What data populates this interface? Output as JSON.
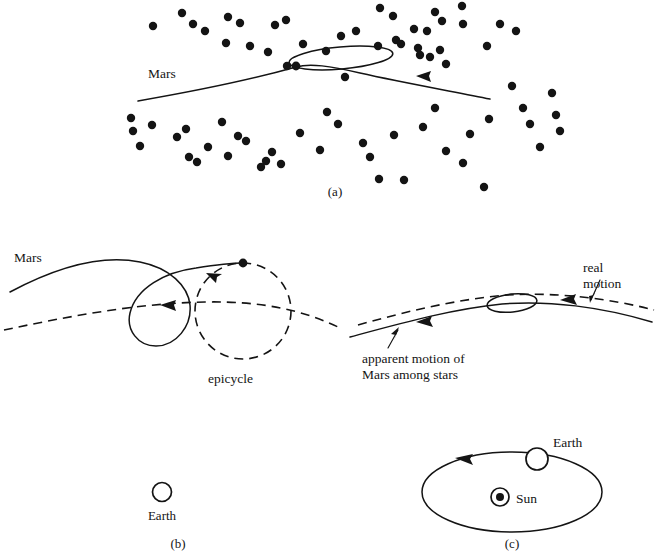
{
  "figure": {
    "background_color": "#ffffff",
    "ink_color": "#141414"
  },
  "panels": [
    {
      "id": "a",
      "caption": "(a)",
      "caption_x": 335,
      "caption_y": 196,
      "description": "Apparent path of Mars among the stars showing a retrograde loop",
      "labels": [
        {
          "name": "mars-label",
          "text": "Mars",
          "x": 148,
          "y": 78
        }
      ]
    },
    {
      "id": "b",
      "caption": "(b)",
      "caption_x": 178,
      "caption_y": 548,
      "description": "Ptolemaic epicycle explanation with deferent and epicycle",
      "labels": [
        {
          "name": "mars-label",
          "text": "Mars",
          "x": 14,
          "y": 262
        },
        {
          "name": "epicycle-label",
          "text": "epicycle",
          "x": 208,
          "y": 383
        },
        {
          "name": "earth-label",
          "text": "Earth",
          "x": 145,
          "y": 516
        }
      ]
    },
    {
      "id": "c",
      "caption": "(c)",
      "caption_x": 512,
      "caption_y": 548,
      "description": "Heliocentric explanation: Earth orbiting the Sun overtakes Mars",
      "labels": [
        {
          "name": "real-motion-label-line1",
          "text": "real",
          "x": 583,
          "y": 280
        },
        {
          "name": "real-motion-label-line2",
          "text": "motion",
          "x": 583,
          "y": 295
        },
        {
          "name": "apparent-motion-label-line1",
          "text": "apparent motion of",
          "x": 362,
          "y": 361
        },
        {
          "name": "apparent-motion-label-line2",
          "text": "Mars among stars",
          "x": 362,
          "y": 376
        },
        {
          "name": "earth-label",
          "text": "Earth",
          "x": 524,
          "y": 443
        },
        {
          "name": "sun-label",
          "text": "Sun",
          "x": 519,
          "y": 503
        }
      ]
    }
  ],
  "panel_a": {
    "path_points": "138,101 175,93 215,86 258,78 290,70 305,66 330,68 370,76 410,84 450,90 490,98",
    "loop_ellipse": {
      "cx": 341,
      "cy": 58,
      "rx": 52,
      "ry": 11,
      "rotation": -5
    },
    "mars_dot": {
      "cx": 296,
      "cy": 66,
      "r": 4.2
    },
    "arrow": {
      "x": 424,
      "y": 76,
      "direction": "left"
    },
    "stars": [
      [
        153,
        26
      ],
      [
        182,
        13
      ],
      [
        193,
        24
      ],
      [
        205,
        31
      ],
      [
        226,
        43
      ],
      [
        228,
        17
      ],
      [
        240,
        23
      ],
      [
        250,
        46
      ],
      [
        268,
        52
      ],
      [
        275,
        25
      ],
      [
        286,
        20
      ],
      [
        287,
        66
      ],
      [
        303,
        44
      ],
      [
        326,
        51
      ],
      [
        341,
        36
      ],
      [
        345,
        77
      ],
      [
        356,
        31
      ],
      [
        378,
        46
      ],
      [
        380,
        8
      ],
      [
        393,
        16
      ],
      [
        396,
        40
      ],
      [
        401,
        44
      ],
      [
        414,
        29
      ],
      [
        418,
        48
      ],
      [
        420,
        55
      ],
      [
        427,
        31
      ],
      [
        430,
        57
      ],
      [
        435,
        12
      ],
      [
        440,
        50
      ],
      [
        442,
        21
      ],
      [
        446,
        64
      ],
      [
        462,
        6
      ],
      [
        463,
        24
      ],
      [
        487,
        46
      ],
      [
        500,
        24
      ],
      [
        516,
        31
      ],
      [
        131,
        118
      ],
      [
        133,
        131
      ],
      [
        140,
        146
      ],
      [
        152,
        125
      ],
      [
        177,
        137
      ],
      [
        186,
        129
      ],
      [
        189,
        157
      ],
      [
        197,
        162
      ],
      [
        208,
        147
      ],
      [
        222,
        122
      ],
      [
        228,
        156
      ],
      [
        238,
        136
      ],
      [
        246,
        141
      ],
      [
        261,
        167
      ],
      [
        266,
        161
      ],
      [
        272,
        152
      ],
      [
        281,
        164
      ],
      [
        300,
        133
      ],
      [
        320,
        150
      ],
      [
        327,
        112
      ],
      [
        338,
        124
      ],
      [
        363,
        143
      ],
      [
        370,
        157
      ],
      [
        379,
        179
      ],
      [
        394,
        135
      ],
      [
        404,
        180
      ],
      [
        423,
        127
      ],
      [
        435,
        108
      ],
      [
        446,
        151
      ],
      [
        463,
        163
      ],
      [
        470,
        134
      ],
      [
        484,
        187
      ],
      [
        489,
        119
      ],
      [
        512,
        86
      ],
      [
        523,
        108
      ],
      [
        530,
        124
      ],
      [
        540,
        147
      ],
      [
        552,
        93
      ],
      [
        556,
        115
      ],
      [
        560,
        131
      ]
    ]
  },
  "panel_b": {
    "mars_loop_path": "M 10,292 C 60,268 110,255 152,268 C 190,280 198,305 190,322 C 182,340 158,352 142,340 C 124,327 128,300 152,288 C 186,270 216,263 243,263",
    "deferent_path": "M 4,327 C 60,314 130,302 200,302 C 260,302 300,310 335,325",
    "epicycle_circle": {
      "cx": 243,
      "cy": 311,
      "r": 48
    },
    "mars_dot": {
      "cx": 243,
      "cy": 263,
      "r": 4.2
    },
    "loop_arrow": {
      "x": 172,
      "y": 305,
      "direction": "left"
    },
    "epicycle_arrow": {
      "x": 212,
      "y": 275,
      "direction": "upper-left"
    },
    "earth_symbol": {
      "cx": 162,
      "cy": 492,
      "r": 9.5,
      "style": "open-circle"
    }
  },
  "panel_c": {
    "apparent_path": "M 350,335 C 400,322 450,308 500,303 C 545,300 600,306 650,320",
    "real_path_dashed": "M 355,325 C 405,312 455,300 505,296 C 550,293 605,299 652,311",
    "loop_ellipse": {
      "cx": 512,
      "cy": 305,
      "rx": 25,
      "ry": 9
    },
    "apparent_arrow": {
      "x": 424,
      "y": 321,
      "direction": "left"
    },
    "real_arrow": {
      "x": 568,
      "y": 300,
      "direction": "left"
    },
    "real_motion_leader": "M 578,300 L 590,277",
    "apparent_motion_leader": "M 388,345 L 400,324",
    "orbit_ellipse": {
      "cx": 512,
      "cy": 492,
      "rx": 90,
      "ry": 40
    },
    "earth_symbol": {
      "cx": 537,
      "cy": 460,
      "r": 11,
      "style": "open-circle"
    },
    "sun_symbol": {
      "cx": 500,
      "cy": 497,
      "r_outer": 9,
      "r_inner": 4,
      "style": "circled-dot"
    },
    "orbit_arrow": {
      "x": 464,
      "y": 458,
      "direction": "left"
    }
  }
}
